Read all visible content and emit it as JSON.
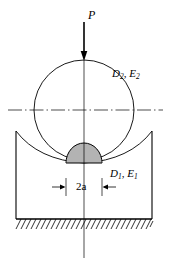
{
  "figure": {
    "background_color": "#ffffff",
    "line_color": "#000000",
    "width": 171,
    "height": 261
  },
  "labels": {
    "load": "P",
    "upper_body": "D2, E2",
    "upper_body_symbol": "D",
    "upper_body_sub": "2",
    "upper_body_modulus": "E",
    "upper_body_modulus_sub": "2",
    "lower_body_symbol": "D",
    "lower_body_sub": "1",
    "lower_body_modulus": "E",
    "lower_body_modulus_sub": "1",
    "lower_body": "D1, E1",
    "contact_width": "2a",
    "separator": ", "
  },
  "geometry": {
    "load_arrow": {
      "x": 84,
      "y_start": 22,
      "y_end": 60,
      "head_width": 6,
      "head_length": 9
    },
    "sphere": {
      "center_x": 84,
      "center_y": 110,
      "radius": 50
    },
    "horizontal_centerline": {
      "y": 110,
      "x_start": 8,
      "x_end": 163,
      "dash_pattern": "dash-dot"
    },
    "vertical_centerline": {
      "x": 84,
      "y_start": 60,
      "y_end": 258,
      "dash_pattern": "solid-thin"
    },
    "seat_block": {
      "left_x": 16,
      "right_x": 152,
      "top_y": 131,
      "base_y": 219
    },
    "concave_arc": {
      "left_x": 16,
      "right_x": 152,
      "top_y": 131,
      "contact_y": 163,
      "contact_x": 84
    },
    "pressure_distribution": {
      "center_x": 84,
      "base_y": 163,
      "half_width": 18,
      "peak_height": 20,
      "hatch_line_count": 17,
      "hatch_direction": "vertical"
    },
    "dimension_line": {
      "y": 187,
      "left_tick_x": 66,
      "right_tick_x": 102,
      "tick_top_y": 178,
      "tick_bottom_y": 196,
      "arrow_outer_left_x": 52,
      "arrow_outer_right_x": 116
    },
    "ground_hatching": {
      "y_top": 219,
      "y_bottom": 229,
      "x_start": 16,
      "x_end": 152,
      "stroke_count": 28,
      "angle": "45deg"
    }
  }
}
